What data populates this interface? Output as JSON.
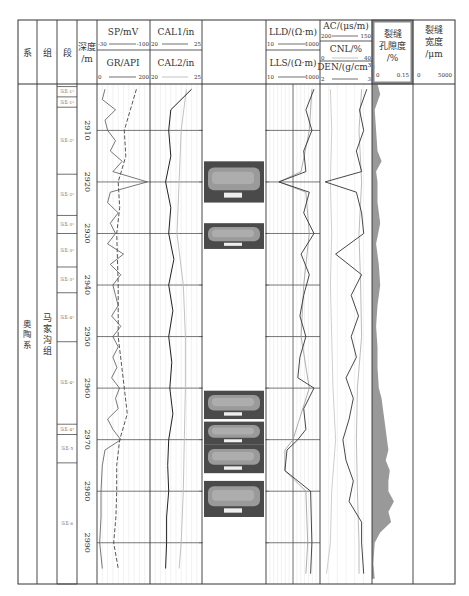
{
  "header": {
    "columns": [
      {
        "key": "system",
        "label": "系"
      },
      {
        "key": "formation",
        "label": "组"
      },
      {
        "key": "member",
        "label": "段"
      },
      {
        "key": "depth",
        "label": "深度",
        "unit": "/m"
      },
      {
        "key": "sp",
        "label": "SP/mV",
        "scale": [
          "-30",
          "-100"
        ]
      },
      {
        "key": "gr",
        "label": "GR/API",
        "scale": [
          "0",
          "200"
        ]
      },
      {
        "key": "cal1",
        "label": "CAL1/in",
        "scale": [
          "20",
          "25"
        ]
      },
      {
        "key": "cal2",
        "label": "CAL2/in",
        "scale": [
          "20",
          "25"
        ]
      },
      {
        "key": "core",
        "label": ""
      },
      {
        "key": "lld",
        "label": "LLD/(Ω·m)",
        "scale": [
          "10",
          "1000"
        ]
      },
      {
        "key": "lls",
        "label": "LLS/(Ω·m)",
        "scale": [
          "10",
          "1000"
        ]
      },
      {
        "key": "ac",
        "label": "AC/(μs/m)",
        "scale": [
          "200",
          "150"
        ]
      },
      {
        "key": "cnl",
        "label": "CNL/%",
        "scale": [
          "0",
          "40"
        ]
      },
      {
        "key": "den",
        "label": "DEN/(g/cm³)",
        "scale": [
          "2",
          "3"
        ]
      },
      {
        "key": "frac_por",
        "label_lines": [
          "裂缝",
          "孔隙度",
          "/%"
        ],
        "scale": [
          "0",
          "0.15"
        ]
      },
      {
        "key": "frac_width",
        "label_lines": [
          "裂缝",
          "宽度",
          "/μm"
        ],
        "scale": [
          "0",
          "5000"
        ]
      }
    ]
  },
  "strat": {
    "system": "奥陶系",
    "formation": "马家沟组",
    "members": [
      {
        "label": "马五-1¹",
        "top": 2901.5,
        "bottom": 2903.5
      },
      {
        "label": "马五-1²",
        "top": 2903.5,
        "bottom": 2905.5
      },
      {
        "label": "马五-2¹",
        "top": 2905.5,
        "bottom": 2918.5
      },
      {
        "label": "马五-2²",
        "top": 2918.5,
        "bottom": 2926.5
      },
      {
        "label": "马五-3¹",
        "top": 2926.5,
        "bottom": 2930
      },
      {
        "label": "马五-3²",
        "top": 2930,
        "bottom": 2936.5
      },
      {
        "label": "马五-3³",
        "top": 2936.5,
        "bottom": 2941.5
      },
      {
        "label": "马五-4¹",
        "top": 2941.5,
        "bottom": 2951
      },
      {
        "label": "马五-4²",
        "top": 2951,
        "bottom": 2967
      },
      {
        "label": "马五-4³",
        "top": 2967,
        "bottom": 2969
      },
      {
        "label": "马五-5",
        "top": 2969,
        "bottom": 2974.5
      },
      {
        "label": "马五-6",
        "top": 2974.5,
        "bottom": 2998
      }
    ]
  },
  "chart_data": {
    "type": "line",
    "ylabel": "深度/m",
    "ylim": [
      2901,
      2998
    ],
    "depth_ticks": [
      2910,
      2920,
      2930,
      2940,
      2950,
      2960,
      2970,
      2980,
      2990
    ],
    "core_photos": [
      {
        "top": 2916,
        "bottom": 2924
      },
      {
        "top": 2928,
        "bottom": 2933
      },
      {
        "top": 2960.5,
        "bottom": 2966
      },
      {
        "top": 2966.5,
        "bottom": 2971
      },
      {
        "top": 2971,
        "bottom": 2976.5
      },
      {
        "top": 2978,
        "bottom": 2985
      }
    ],
    "series": [
      {
        "name": "SP",
        "unit": "mV",
        "range": [
          -30,
          -100
        ],
        "style": "dashed",
        "depth": [
          2902,
          2910,
          2915,
          2920,
          2925,
          2930,
          2940,
          2950,
          2960,
          2965,
          2970,
          2975,
          2980,
          2985,
          2990,
          2995
        ],
        "values": [
          -82,
          -66,
          -68,
          -58,
          -60,
          -56,
          -58,
          -58,
          -66,
          -70,
          -60,
          -56,
          -56,
          -55,
          -52,
          -58
        ]
      },
      {
        "name": "GR",
        "unit": "API",
        "range": [
          0,
          200
        ],
        "style": "solid",
        "depth": [
          2902,
          2904,
          2906,
          2908,
          2910,
          2912,
          2914,
          2916,
          2918,
          2920,
          2922,
          2924,
          2926,
          2928,
          2930,
          2932,
          2934,
          2936,
          2938,
          2940,
          2942,
          2944,
          2946,
          2948,
          2950,
          2952,
          2954,
          2956,
          2958,
          2960,
          2962,
          2964,
          2966,
          2968,
          2970,
          2972,
          2975,
          2980,
          2985,
          2990,
          2995
        ],
        "values": [
          30,
          20,
          70,
          30,
          40,
          70,
          50,
          95,
          60,
          190,
          50,
          40,
          80,
          50,
          70,
          40,
          100,
          50,
          90,
          60,
          70,
          80,
          55,
          90,
          60,
          80,
          60,
          75,
          55,
          85,
          70,
          80,
          40,
          60,
          90,
          30,
          20,
          15,
          15,
          10,
          20
        ]
      },
      {
        "name": "CAL1",
        "unit": "in",
        "range": [
          20,
          25
        ],
        "style": "solid",
        "depth": [
          2902,
          2906,
          2910,
          2915,
          2920,
          2925,
          2930,
          2935,
          2940,
          2945,
          2950,
          2955,
          2960,
          2965,
          2970,
          2975,
          2980,
          2985,
          2990,
          2995
        ],
        "values": [
          24,
          22,
          21.8,
          22,
          21.5,
          22,
          21.8,
          22.3,
          21.8,
          22.2,
          21.8,
          22.1,
          21.9,
          22.2,
          21.8,
          21.7,
          21.8,
          21.6,
          21.6,
          21.5
        ]
      },
      {
        "name": "CAL2",
        "unit": "in",
        "range": [
          20,
          25
        ],
        "style": "light",
        "depth": [
          2902,
          2910,
          2920,
          2930,
          2940,
          2950,
          2960,
          2970,
          2980,
          2990,
          2995
        ],
        "values": [
          23.5,
          23,
          22.8,
          22.6,
          23.2,
          23.4,
          23.4,
          23.3,
          23.2,
          23.0,
          22.8
        ]
      },
      {
        "name": "LLD",
        "unit": "Ω·m",
        "range": [
          10,
          1000
        ],
        "scale": "log",
        "depth": [
          2902,
          2906,
          2910,
          2914,
          2918,
          2920,
          2922,
          2926,
          2930,
          2934,
          2938,
          2942,
          2946,
          2950,
          2954,
          2958,
          2960,
          2964,
          2968,
          2970,
          2972,
          2976,
          2980,
          2990,
          2996
        ],
        "values": [
          600,
          300,
          500,
          250,
          300,
          30,
          400,
          250,
          600,
          200,
          400,
          250,
          180,
          300,
          180,
          150,
          600,
          250,
          300,
          150,
          60,
          50,
          450,
          500,
          450
        ]
      },
      {
        "name": "LLS",
        "unit": "Ω·m",
        "range": [
          10,
          1000
        ],
        "scale": "log",
        "depth": [
          2902,
          2910,
          2918,
          2920,
          2922,
          2930,
          2940,
          2950,
          2960,
          2965,
          2970,
          2972,
          2976,
          2980,
          2990,
          2996
        ],
        "values": [
          500,
          400,
          200,
          30,
          300,
          400,
          250,
          200,
          400,
          200,
          100,
          50,
          50,
          300,
          350,
          300
        ]
      },
      {
        "name": "AC",
        "unit": "μs/m",
        "range": [
          200,
          150
        ],
        "depth": [
          2902,
          2906,
          2910,
          2914,
          2918,
          2920,
          2922,
          2926,
          2930,
          2934,
          2938,
          2942,
          2946,
          2950,
          2954,
          2958,
          2962,
          2966,
          2970,
          2974,
          2978,
          2982,
          2986,
          2990,
          2996
        ],
        "values": [
          155,
          162,
          158,
          165,
          160,
          195,
          165,
          160,
          158,
          185,
          160,
          170,
          163,
          170,
          165,
          175,
          168,
          172,
          178,
          175,
          168,
          172,
          160,
          160,
          158
        ]
      },
      {
        "name": "CNL",
        "unit": "%",
        "range": [
          0,
          40
        ],
        "depth": [
          2902,
          2910,
          2920,
          2930,
          2940,
          2950,
          2960,
          2970,
          2980,
          2990,
          2996
        ],
        "values": [
          8,
          9,
          8,
          9,
          8,
          9,
          10,
          12,
          9,
          8,
          5
        ]
      },
      {
        "name": "DEN",
        "unit": "g/cm³",
        "range": [
          2,
          3
        ],
        "depth": [
          2902,
          2910,
          2920,
          2930,
          2940,
          2950,
          2960,
          2970,
          2980,
          2990,
          2996
        ],
        "values": [
          2.8,
          2.75,
          2.8,
          2.75,
          2.78,
          2.8,
          2.72,
          2.7,
          2.72,
          2.75,
          2.75
        ]
      },
      {
        "name": "FracPorosity",
        "unit": "%",
        "range": [
          0,
          0.15
        ],
        "style": "filled",
        "depth": [
          2901,
          2903,
          2906,
          2910,
          2914,
          2916,
          2918,
          2920,
          2924,
          2928,
          2932,
          2936,
          2940,
          2944,
          2948,
          2952,
          2956,
          2960,
          2962,
          2964,
          2966,
          2968,
          2970,
          2972,
          2974,
          2976,
          2978,
          2980,
          2982,
          2984,
          2986,
          2988,
          2990,
          2994,
          2997
        ],
        "values": [
          0.02,
          0.03,
          0.01,
          0.015,
          0.02,
          0.035,
          0.015,
          0.02,
          0.02,
          0.03,
          0.015,
          0.025,
          0.03,
          0.02,
          0.015,
          0.02,
          0.02,
          0.025,
          0.035,
          0.04,
          0.045,
          0.05,
          0.055,
          0.06,
          0.05,
          0.065,
          0.06,
          0.06,
          0.08,
          0.06,
          0.07,
          0.03,
          0.01,
          0.005,
          0.01
        ]
      },
      {
        "name": "FracWidth",
        "unit": "μm",
        "range": [
          0,
          5000
        ],
        "values": []
      }
    ]
  }
}
